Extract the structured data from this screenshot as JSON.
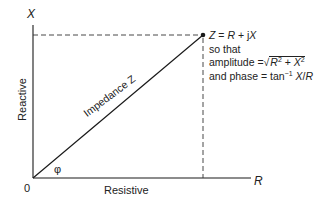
{
  "diagram": {
    "type": "phasor-diagram",
    "axes": {
      "vertical": {
        "symbol": "X",
        "label": "Reactive"
      },
      "horizontal": {
        "symbol": "R",
        "label": "Resistive"
      },
      "origin": "0"
    },
    "vector": {
      "label": "Impedance Z",
      "angle_symbol": "φ"
    },
    "annotation": {
      "line1": {
        "lhs": "Z",
        "eq": " = ",
        "r": "R",
        "plus": " + j",
        "x": "X"
      },
      "line2": "so that",
      "line3": {
        "prefix": "amplitude =",
        "root": "√",
        "r": "R",
        "exp1": "2",
        "plus": " + ",
        "x": "X",
        "exp2": "2"
      },
      "line4": {
        "prefix": "and phase = tan",
        "exp": "−1",
        "x": " X",
        "slash": "/",
        "r": "R"
      }
    },
    "colors": {
      "line": "#1a1a1a",
      "background": "#ffffff"
    }
  }
}
